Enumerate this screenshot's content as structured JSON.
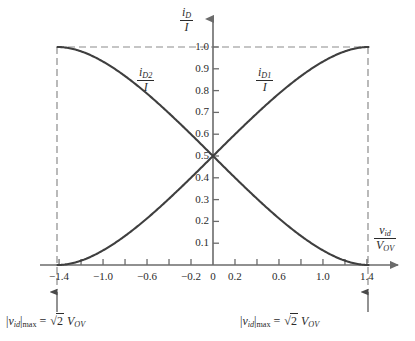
{
  "chart_data": {
    "type": "line",
    "title": "",
    "subtitle": "",
    "xlabel": "v_id / V_OV",
    "ylabel": "i_D / I",
    "xlim": [
      -1.6,
      1.6
    ],
    "ylim": [
      0.0,
      1.08
    ],
    "grid": false,
    "legend_position": "inline-annotations",
    "x_ticks_major": [
      -1.4,
      -1.0,
      -0.6,
      -0.2,
      0,
      0.2,
      0.6,
      1.0,
      1.4
    ],
    "x_tick_labels": [
      "-1.4",
      "-1.0",
      "-0.6",
      "-0.2",
      "0",
      "0.2",
      "0.6",
      "1.0",
      "1.4"
    ],
    "x_ticks_minor": [
      -1.2,
      -0.8,
      -0.4,
      0.4,
      0.8,
      1.2
    ],
    "y_ticks": [
      0.1,
      0.2,
      0.3,
      0.4,
      0.5,
      0.6,
      0.7,
      0.8,
      0.9,
      1.0
    ],
    "y_tick_labels": [
      "0.1",
      "0.2",
      "0.3",
      "0.4",
      "0.5",
      "0.6",
      "0.7",
      "0.8",
      "0.9",
      "1.0"
    ],
    "x": [
      -1.4142,
      -1.35,
      -1.3,
      -1.25,
      -1.2,
      -1.1,
      -1.0,
      -0.9,
      -0.8,
      -0.7,
      -0.6,
      -0.5,
      -0.4,
      -0.3,
      -0.2,
      -0.1,
      0,
      0.1,
      0.2,
      0.3,
      0.4,
      0.5,
      0.6,
      0.7,
      0.8,
      0.9,
      1.0,
      1.1,
      1.2,
      1.25,
      1.3,
      1.35,
      1.4142
    ],
    "series": [
      {
        "name": "i_D1 / I",
        "label_num": "i",
        "label_sub": "D1",
        "label_den": "I",
        "color": "#3f3f3f",
        "values": [
          0.0,
          0.0167,
          0.0312,
          0.0482,
          0.0681,
          0.1159,
          0.1775,
          0.2525,
          0.3394,
          0.435,
          0.5,
          0.5,
          0.5,
          0.5,
          0.5,
          0.5,
          0.5,
          0.5,
          0.5,
          0.5,
          0.5,
          0.5,
          0.5,
          0.5,
          0.5,
          0.5,
          0.5,
          0.5,
          0.5,
          0.5,
          0.5,
          0.5,
          1.0
        ]
      },
      {
        "name": "i_D2 / I",
        "label_num": "i",
        "label_sub": "D2",
        "label_den": "I",
        "color": "#3f3f3f",
        "values": [
          1.0,
          0.9833,
          0.9688,
          0.9518,
          0.9319,
          0.8841,
          0.8225,
          0.7475,
          0.6606,
          0.565,
          0.5,
          0.5,
          0.5,
          0.5,
          0.5,
          0.5,
          0.5,
          0.5,
          0.5,
          0.5,
          0.5,
          0.5,
          0.5,
          0.5,
          0.5,
          0.5,
          0.5,
          0.5,
          0.5,
          0.5,
          0.5,
          0.5,
          0.0
        ]
      }
    ],
    "key_points": {
      "crossing_x": 0,
      "crossing_y": 0.5,
      "saturation_left_x": -1.4142,
      "saturation_right_x": 1.4142,
      "saturation_value": 1.0
    },
    "guide_lines": {
      "top_horizontal_y": 1.0,
      "left_vertical_x": -1.4142,
      "right_vertical_x": 1.4142,
      "style": "dashed",
      "color": "#8c8c8c"
    }
  },
  "axes": {
    "y_title": {
      "numerator_var": "i",
      "numerator_sub": "D",
      "denominator": "I"
    },
    "x_title": {
      "numerator_var": "v",
      "numerator_sub": "id",
      "denominator_var": "V",
      "denominator_sub": "OV"
    }
  },
  "annotations": {
    "left": {
      "bar_open": "|",
      "var": "v",
      "var_sub": "id",
      "bar_close": "|",
      "max_sub": "max",
      "equals": "=",
      "radical": "√",
      "radicand": "2",
      "result_var": "V",
      "result_sub": "OV",
      "full_text": "|v_id|max = √2 V_OV"
    },
    "right": {
      "bar_open": "|",
      "var": "v",
      "var_sub": "id",
      "bar_close": "|",
      "max_sub": "max",
      "equals": "=",
      "radical": "√",
      "radicand": "2",
      "result_var": "V",
      "result_sub": "OV",
      "full_text": "|v_id|max = √2 V_OV"
    }
  },
  "colors": {
    "curve": "#3f3f3f",
    "axis": "#6b6b6b",
    "dashed_guide": "#8c8c8c",
    "text": "#2b2b2b",
    "background": "#ffffff"
  },
  "curve_labels": {
    "left_curve": "i_D2 / I",
    "right_curve": "i_D1 / I"
  }
}
